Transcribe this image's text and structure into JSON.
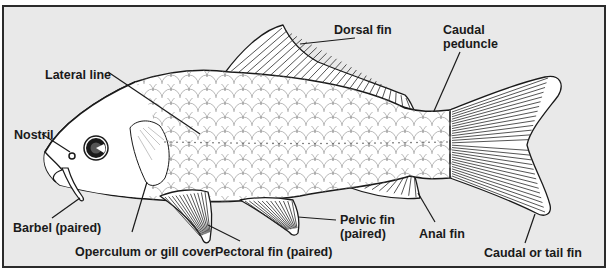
{
  "diagram": {
    "colors": {
      "background": "#e9e9e9",
      "frame": "#2b2b2b",
      "ink": "#1a1a1a",
      "body_fill": "#ffffff"
    },
    "labels": {
      "dorsal_fin": "Dorsal fin",
      "caudal_peduncle_line1": "Caudal",
      "caudal_peduncle_line2": "peduncle",
      "lateral_line": "Lateral line",
      "nostril": "Nostril",
      "barbel": "Barbel (paired)",
      "operculum": "Operculum or gill cover",
      "pectoral_fin": "Pectoral fin (paired)",
      "pelvic_fin_line1": "Pelvic fin",
      "pelvic_fin_line2": "(paired)",
      "anal_fin": "Anal fin",
      "caudal_fin": "Caudal or tail fin"
    }
  }
}
